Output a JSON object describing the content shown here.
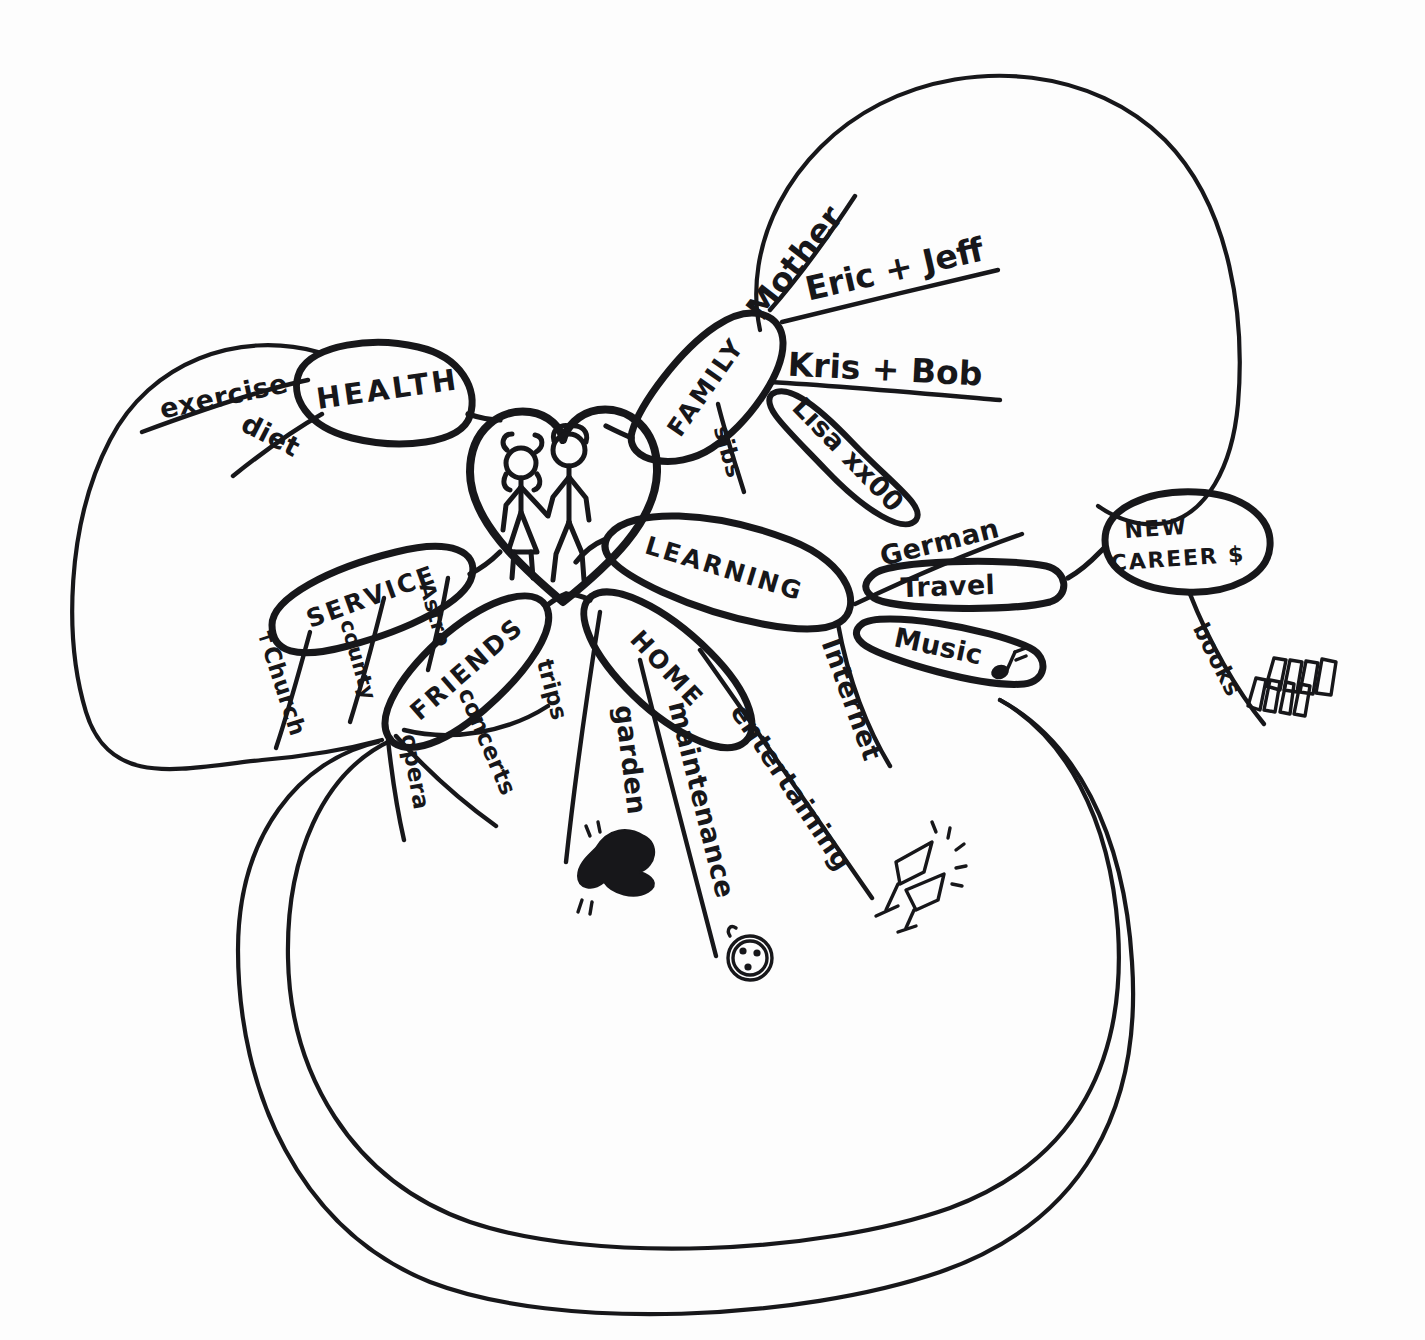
{
  "center": {
    "icon": "heart-with-couple-icon",
    "figures": [
      "female-stick-figure",
      "male-stick-figure"
    ]
  },
  "branches": [
    {
      "key": "health",
      "label": "HEALTH",
      "children": [
        {
          "label": "exercise"
        },
        {
          "label": "diet"
        }
      ]
    },
    {
      "key": "family",
      "label": "FAMILY",
      "children": [
        {
          "label": "Mother"
        },
        {
          "label": "Eric + Jeff"
        },
        {
          "label": "Kris + Bob"
        },
        {
          "label": "sibs"
        },
        {
          "label": "Lisa xx00"
        }
      ]
    },
    {
      "key": "learning",
      "label": "LEARNING",
      "children": [
        {
          "label": "German"
        },
        {
          "label": "Travel"
        },
        {
          "label": "Music",
          "icon": "music-note-icon"
        },
        {
          "label": "Internet"
        }
      ]
    },
    {
      "key": "home",
      "label": "HOME",
      "children": [
        {
          "label": "garden",
          "icon": "plant-doodle-icon"
        },
        {
          "label": "maintenance",
          "icon": "wreath-face-doodle-icon"
        },
        {
          "label": "entertaining",
          "icon": "champagne-glasses-doodle-icon"
        }
      ]
    },
    {
      "key": "friends",
      "label": "FRIENDS",
      "children": [
        {
          "label": "opera"
        },
        {
          "label": "concerts"
        },
        {
          "label": "trips"
        }
      ]
    },
    {
      "key": "service",
      "label": "SERVICE",
      "children": [
        {
          "label": "✝Church"
        },
        {
          "label": "county"
        },
        {
          "label": "Astro"
        }
      ]
    },
    {
      "key": "new-career",
      "label": "NEW CAREER $",
      "label_line1": "NEW",
      "label_line2": "CAREER $",
      "children": [
        {
          "label": "books",
          "icon": "bookshelf-doodle-icon"
        }
      ]
    }
  ],
  "colors": {
    "ink": "#17171a",
    "paper": "#fdfdfd"
  }
}
